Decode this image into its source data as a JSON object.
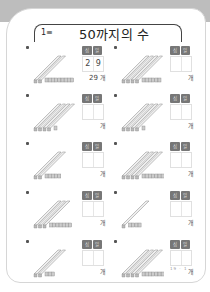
{
  "page": {
    "title_number": "1≡",
    "title": "50까지의 수",
    "page_number": "19 · 1",
    "header_tens": "십",
    "header_ones": "일",
    "unit": "개"
  },
  "problems": [
    {
      "tens": 2,
      "ones": 9,
      "ans_tens": "2",
      "ans_ones": "9",
      "result": "29"
    },
    {
      "tens": 4,
      "ones": 6,
      "ans_tens": "",
      "ans_ones": "",
      "result": ""
    },
    {
      "tens": 4,
      "ones": 1,
      "ans_tens": "",
      "ans_ones": "",
      "result": ""
    },
    {
      "tens": 4,
      "ones": 1,
      "ans_tens": "",
      "ans_ones": "",
      "result": ""
    },
    {
      "tens": 2,
      "ones": 5,
      "ans_tens": "",
      "ans_ones": "",
      "result": ""
    },
    {
      "tens": 4,
      "ones": 8,
      "ans_tens": "",
      "ans_ones": "",
      "result": ""
    },
    {
      "tens": 3,
      "ones": 7,
      "ans_tens": "",
      "ans_ones": "",
      "result": ""
    },
    {
      "tens": 1,
      "ones": 4,
      "ans_tens": "",
      "ans_ones": "",
      "result": ""
    },
    {
      "tens": 2,
      "ones": 3,
      "ans_tens": "",
      "ans_ones": "",
      "result": ""
    },
    {
      "tens": 4,
      "ones": 9,
      "ans_tens": "",
      "ans_ones": "",
      "result": ""
    }
  ]
}
